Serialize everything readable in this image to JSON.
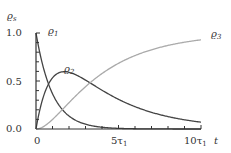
{
  "chart_data": {
    "type": "line",
    "title": "",
    "xlabel": "t",
    "ylabel": "ϱs",
    "xlim": [
      0,
      10
    ],
    "ylim": [
      0,
      1.0
    ],
    "x_ticks": [
      {
        "value": 0,
        "label": "0"
      },
      {
        "value": 5,
        "label": "5τ1"
      },
      {
        "value": 10,
        "label": "10τ1"
      }
    ],
    "y_ticks": [
      {
        "value": 0.0,
        "label": "0.0"
      },
      {
        "value": 0.5,
        "label": "0.5"
      },
      {
        "value": 1.0,
        "label": "1.0"
      }
    ],
    "x": [
      0,
      0.5,
      1,
      1.5,
      2,
      2.5,
      3,
      4,
      5,
      6,
      7,
      8,
      9,
      10
    ],
    "series": [
      {
        "name": "ϱ1",
        "color": "#444444",
        "values": [
          1.0,
          0.61,
          0.37,
          0.22,
          0.14,
          0.08,
          0.05,
          0.02,
          0.01,
          0.0,
          0.0,
          0.0,
          0.0,
          0.0
        ]
      },
      {
        "name": "ϱ2",
        "color": "#444444",
        "values": [
          0.0,
          0.33,
          0.49,
          0.56,
          0.58,
          0.57,
          0.54,
          0.47,
          0.39,
          0.31,
          0.25,
          0.2,
          0.15,
          0.12
        ]
      },
      {
        "name": "ϱ3",
        "color": "#aaaaaa",
        "values": [
          0.0,
          0.06,
          0.14,
          0.22,
          0.28,
          0.35,
          0.41,
          0.51,
          0.6,
          0.69,
          0.75,
          0.8,
          0.85,
          0.88
        ]
      }
    ],
    "legend": "inline labels",
    "grid": false
  },
  "labels": {
    "y_axis": "ϱ",
    "y_axis_sub": "s",
    "x_axis": "t",
    "rho1": "ϱ",
    "rho1_sub": "1",
    "rho2": "ϱ",
    "rho2_sub": "2",
    "rho3": "ϱ",
    "rho3_sub": "3",
    "ytick_0": "0.0",
    "ytick_05": "0.5",
    "ytick_1": "1.0",
    "xtick_0": "0",
    "xtick_5": "5τ",
    "xtick_5_sub": "1",
    "xtick_10": "10τ",
    "xtick_10_sub": "1"
  }
}
